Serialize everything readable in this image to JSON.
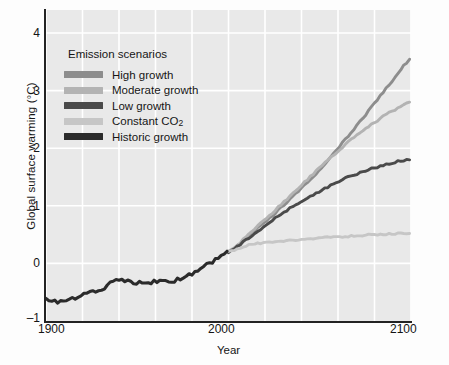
{
  "chart_data": {
    "type": "line",
    "title": "",
    "xlabel": "Year",
    "ylabel": "Global surface warming (°C)",
    "xlim": [
      1900,
      2100
    ],
    "ylim": [
      -1,
      4.4
    ],
    "xticks": [
      1900,
      2000,
      2100
    ],
    "yticks": [
      -1,
      0,
      1,
      2,
      3,
      4
    ],
    "ytick_labels": [
      "–1",
      "0",
      "1",
      "2",
      "3",
      "4"
    ],
    "xtick_labels": [
      "1900",
      "2000",
      "2100"
    ],
    "grid": "white gridlines, vertical every 20 years, horizontal every 1 °C",
    "plot_background": "#e9e9e9",
    "legend_position": "upper-left inside plot",
    "legend_title": "Emission scenarios",
    "series": [
      {
        "name": "High growth",
        "color": "#8d8d8d",
        "x": [
          2000,
          2010,
          2020,
          2030,
          2040,
          2050,
          2060,
          2070,
          2080,
          2090,
          2100
        ],
        "values": [
          0.2,
          0.45,
          0.72,
          1.0,
          1.3,
          1.63,
          2.0,
          2.38,
          2.78,
          3.18,
          3.55
        ]
      },
      {
        "name": "Moderate growth",
        "color": "#b3b3b3",
        "x": [
          2000,
          2010,
          2020,
          2030,
          2040,
          2050,
          2060,
          2070,
          2080,
          2090,
          2100
        ],
        "values": [
          0.2,
          0.47,
          0.76,
          1.06,
          1.36,
          1.66,
          1.95,
          2.22,
          2.45,
          2.65,
          2.8
        ]
      },
      {
        "name": "Low growth",
        "color": "#4a4a4a",
        "x": [
          2000,
          2010,
          2020,
          2030,
          2040,
          2050,
          2060,
          2070,
          2080,
          2090,
          2100
        ],
        "values": [
          0.2,
          0.42,
          0.65,
          0.88,
          1.08,
          1.25,
          1.42,
          1.55,
          1.66,
          1.75,
          1.8
        ]
      },
      {
        "name": "Constant CO₂",
        "color": "#c6c6c6",
        "x": [
          2000,
          2010,
          2020,
          2030,
          2040,
          2050,
          2060,
          2070,
          2080,
          2090,
          2100
        ],
        "values": [
          0.2,
          0.31,
          0.36,
          0.39,
          0.42,
          0.44,
          0.46,
          0.48,
          0.5,
          0.51,
          0.52
        ]
      },
      {
        "name": "Historic growth",
        "color": "#2b2b2b",
        "x": [
          1900,
          1910,
          1920,
          1930,
          1940,
          1950,
          1960,
          1970,
          1980,
          1990,
          2000
        ],
        "values": [
          -0.62,
          -0.68,
          -0.52,
          -0.44,
          -0.28,
          -0.33,
          -0.32,
          -0.31,
          -0.17,
          0.0,
          0.2
        ]
      }
    ]
  },
  "axes": {
    "ylabel": "Global surface warming (°C)",
    "xlabel": "Year",
    "yticks": [
      "4",
      "3",
      "2",
      "1",
      "0",
      "–1"
    ],
    "xticks": [
      "1900",
      "2000",
      "2100"
    ]
  },
  "legend": {
    "title": "Emission scenarios",
    "items": [
      {
        "label": "High growth",
        "color": "#8d8d8d"
      },
      {
        "label": "Moderate growth",
        "color": "#b3b3b3"
      },
      {
        "label": "Low growth",
        "color": "#4a4a4a"
      },
      {
        "label": "Constant CO",
        "sub": "2",
        "color": "#c6c6c6"
      },
      {
        "label": "Historic growth",
        "color": "#2b2b2b"
      }
    ]
  }
}
